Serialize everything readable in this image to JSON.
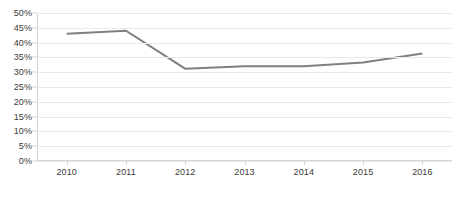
{
  "chart_data": {
    "type": "line",
    "title": "",
    "subtitle": "",
    "xlabel": "",
    "ylabel": "",
    "categories": [
      "2010",
      "2011",
      "2012",
      "2013",
      "2014",
      "2015",
      "2016"
    ],
    "x": [
      2010,
      2011,
      2012,
      2013,
      2014,
      2015,
      2016
    ],
    "values": [
      43.0,
      44.0,
      31.2,
      32.0,
      32.0,
      33.3,
      36.3
    ],
    "series": [
      {
        "name": "",
        "values": [
          43.0,
          44.0,
          31.2,
          32.0,
          32.0,
          33.3,
          36.3
        ]
      }
    ],
    "ylim": [
      0,
      50
    ],
    "ytick_values": [
      0,
      5,
      10,
      15,
      20,
      25,
      30,
      35,
      40,
      45,
      50
    ],
    "ytick_labels": [
      "0%",
      "5%",
      "10%",
      "15%",
      "20%",
      "25%",
      "30%",
      "35%",
      "40%",
      "45%",
      "50%"
    ],
    "xtick_labels": [
      "2010",
      "2011",
      "2012",
      "2013",
      "2014",
      "2015",
      "2016"
    ],
    "grid": true,
    "grid_axis": "y",
    "legend": false,
    "legend_position": "none",
    "annotations": [],
    "colors": {
      "line": "#808080",
      "gridline": "#e9e9e9",
      "axis": "#d3d3d3",
      "text": "#3a3a3a",
      "background": "#ffffff"
    },
    "line_width": 2
  }
}
